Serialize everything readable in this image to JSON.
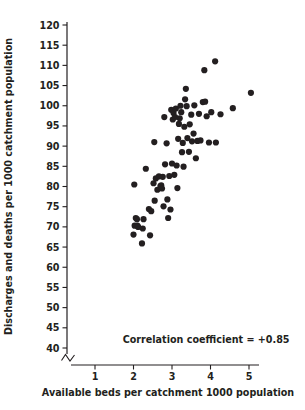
{
  "chart_data": {
    "type": "scatter",
    "title": "",
    "xlabel": "Available beds per catchment 1000 population",
    "ylabel": "Discharges and deaths per 1000 catchment population",
    "xlim": [
      0.45,
      5.45
    ],
    "ylim": [
      38.5,
      121.5
    ],
    "xticks": [
      1,
      2,
      3,
      4,
      5
    ],
    "yticks": [
      40,
      45,
      50,
      55,
      60,
      65,
      70,
      75,
      80,
      85,
      90,
      95,
      100,
      105,
      110,
      115,
      120
    ],
    "xtick_labels": [
      "1",
      "2",
      "3",
      "4",
      "5"
    ],
    "ytick_labels": [
      "40",
      "45",
      "50",
      "55",
      "60",
      "65",
      "70",
      "75",
      "80",
      "85",
      "90",
      "95",
      "100",
      "105",
      "110",
      "115",
      "120"
    ],
    "grid": false,
    "legend": null,
    "y_axis_break": true,
    "y_axis_break_note": "zigzag break mark on y-axis below 40",
    "marker": {
      "shape": "circle",
      "color": "#231f20",
      "size_px": 3.1
    },
    "annotations": [
      {
        "text": "Correlation coefficient = +0.85",
        "x": 1.72,
        "y": 41.3
      }
    ],
    "correlation_coefficient": "+0.85",
    "n_points": 75,
    "points": [
      [
        2.03,
        70.3
      ],
      [
        2.0,
        68.1
      ],
      [
        2.06,
        72.2
      ],
      [
        2.09,
        71.9
      ],
      [
        2.1,
        70.3
      ],
      [
        2.12,
        70.0
      ],
      [
        2.02,
        80.5
      ],
      [
        2.22,
        65.9
      ],
      [
        2.26,
        71.9
      ],
      [
        2.24,
        69.6
      ],
      [
        2.32,
        84.4
      ],
      [
        2.4,
        74.4
      ],
      [
        2.43,
        67.9
      ],
      [
        2.46,
        73.9
      ],
      [
        2.52,
        80.8
      ],
      [
        2.55,
        76.5
      ],
      [
        2.58,
        82.0
      ],
      [
        2.54,
        91.0
      ],
      [
        2.62,
        79.2
      ],
      [
        2.66,
        82.5
      ],
      [
        2.7,
        80.1
      ],
      [
        2.72,
        80.3
      ],
      [
        2.74,
        79.5
      ],
      [
        2.76,
        82.4
      ],
      [
        2.78,
        75.1
      ],
      [
        2.8,
        97.2
      ],
      [
        2.82,
        85.5
      ],
      [
        2.86,
        90.7
      ],
      [
        2.88,
        76.8
      ],
      [
        2.9,
        72.2
      ],
      [
        2.93,
        82.6
      ],
      [
        2.96,
        74.3
      ],
      [
        2.98,
        99.0
      ],
      [
        3.0,
        85.7
      ],
      [
        3.02,
        96.6
      ],
      [
        3.04,
        98.2
      ],
      [
        3.06,
        82.9
      ],
      [
        3.08,
        97.2
      ],
      [
        3.1,
        99.3
      ],
      [
        3.12,
        85.2
      ],
      [
        3.14,
        79.6
      ],
      [
        3.16,
        91.8
      ],
      [
        3.18,
        95.5
      ],
      [
        3.2,
        96.9
      ],
      [
        3.22,
        100.0
      ],
      [
        3.24,
        98.4
      ],
      [
        3.26,
        88.5
      ],
      [
        3.28,
        90.8
      ],
      [
        3.3,
        84.9
      ],
      [
        3.32,
        94.8
      ],
      [
        3.34,
        101.6
      ],
      [
        3.36,
        104.2
      ],
      [
        3.38,
        99.9
      ],
      [
        3.4,
        92.0
      ],
      [
        3.44,
        88.6
      ],
      [
        3.46,
        95.4
      ],
      [
        3.5,
        97.8
      ],
      [
        3.52,
        91.2
      ],
      [
        3.58,
        100.1
      ],
      [
        3.62,
        87.0
      ],
      [
        3.66,
        91.3
      ],
      [
        3.7,
        98.0
      ],
      [
        3.74,
        91.4
      ],
      [
        3.8,
        100.9
      ],
      [
        3.84,
        108.8
      ],
      [
        3.86,
        101.0
      ],
      [
        3.9,
        97.4
      ],
      [
        3.96,
        90.9
      ],
      [
        4.02,
        98.4
      ],
      [
        4.12,
        111.0
      ],
      [
        4.14,
        90.9
      ],
      [
        4.26,
        97.9
      ],
      [
        4.58,
        99.4
      ],
      [
        5.05,
        103.2
      ],
      [
        3.56,
        93.1
      ]
    ]
  },
  "figure": {
    "background_color": "#ffffff",
    "foreground_color": "#231f20"
  }
}
